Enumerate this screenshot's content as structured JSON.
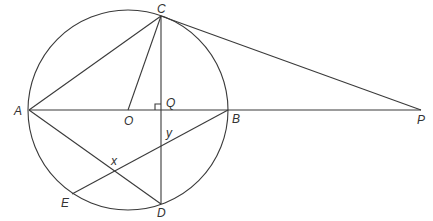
{
  "diagram": {
    "type": "circle-geometry",
    "circle": {
      "center_label": "O",
      "cx": 128,
      "cy": 110,
      "r": 100
    },
    "points": {
      "A": {
        "x": 29,
        "y": 110,
        "label": "A"
      },
      "B": {
        "x": 228,
        "y": 110,
        "label": "B"
      },
      "C": {
        "x": 161,
        "y": 16,
        "label": "C"
      },
      "D": {
        "x": 161,
        "y": 204,
        "label": "D"
      },
      "E": {
        "x": 72,
        "y": 194,
        "label": "E"
      },
      "O": {
        "x": 128,
        "y": 110,
        "label": "O"
      },
      "Q": {
        "x": 161,
        "y": 110,
        "label": "Q"
      },
      "P": {
        "x": 421,
        "y": 110,
        "label": "P"
      }
    },
    "intersections": {
      "x": {
        "label": "x"
      },
      "y": {
        "label": "y"
      }
    },
    "segments": [
      "AP",
      "CD",
      "AC",
      "OC",
      "CP",
      "AD",
      "EB"
    ],
    "right_angle_at": "Q",
    "colors": {
      "line": "#3a3a3a",
      "text": "#333333",
      "background": "#ffffff"
    }
  }
}
